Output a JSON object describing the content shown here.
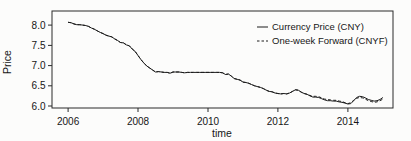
{
  "chart_data": {
    "type": "line",
    "title": "",
    "xlabel": "time",
    "ylabel": "Price",
    "xlim": [
      2005.54,
      2015.29
    ],
    "ylim": [
      5.95,
      8.35
    ],
    "x_ticks": [
      2006,
      2008,
      2010,
      2012,
      2014
    ],
    "y_ticks": [
      6.0,
      6.5,
      7.0,
      7.5,
      8.0
    ],
    "grid": false,
    "legend": {
      "position": "top-right",
      "entries": [
        {
          "label": "Currency Price (CNY)",
          "style": "solid"
        },
        {
          "label": "One-week Forward (CNYF)",
          "style": "dashed"
        }
      ]
    },
    "colors": {
      "line": "#1c1c1c",
      "text": "#161616",
      "border": "#2a2a2a",
      "background": "#fcfcfb"
    },
    "x": [
      2006.0,
      2006.083,
      2006.167,
      2006.25,
      2006.333,
      2006.417,
      2006.5,
      2006.583,
      2006.667,
      2006.75,
      2006.833,
      2006.917,
      2007.0,
      2007.083,
      2007.167,
      2007.25,
      2007.333,
      2007.417,
      2007.5,
      2007.583,
      2007.667,
      2007.75,
      2007.833,
      2007.917,
      2008.0,
      2008.083,
      2008.167,
      2008.25,
      2008.333,
      2008.417,
      2008.5,
      2008.583,
      2008.667,
      2008.75,
      2008.833,
      2008.917,
      2009.0,
      2009.083,
      2009.167,
      2009.25,
      2009.333,
      2009.417,
      2009.5,
      2009.583,
      2009.667,
      2009.75,
      2009.833,
      2009.917,
      2010.0,
      2010.083,
      2010.167,
      2010.25,
      2010.333,
      2010.417,
      2010.5,
      2010.583,
      2010.667,
      2010.75,
      2010.833,
      2010.917,
      2011.0,
      2011.083,
      2011.167,
      2011.25,
      2011.333,
      2011.417,
      2011.5,
      2011.583,
      2011.667,
      2011.75,
      2011.833,
      2011.917,
      2012.0,
      2012.083,
      2012.167,
      2012.25,
      2012.333,
      2012.417,
      2012.5,
      2012.583,
      2012.667,
      2012.75,
      2012.833,
      2012.917,
      2013.0,
      2013.083,
      2013.167,
      2013.25,
      2013.333,
      2013.417,
      2013.5,
      2013.583,
      2013.667,
      2013.75,
      2013.833,
      2013.917,
      2014.0,
      2014.083,
      2014.167,
      2014.25,
      2014.333,
      2014.417,
      2014.5,
      2014.583,
      2014.667,
      2014.75,
      2014.833,
      2014.917,
      2015.0
    ],
    "series": [
      {
        "name": "Currency Price (CNY)",
        "style": "solid",
        "values": [
          8.07,
          8.06,
          8.03,
          8.01,
          8.01,
          8.0,
          7.99,
          7.97,
          7.93,
          7.9,
          7.86,
          7.82,
          7.79,
          7.75,
          7.73,
          7.71,
          7.66,
          7.62,
          7.57,
          7.56,
          7.51,
          7.49,
          7.41,
          7.35,
          7.25,
          7.15,
          7.06,
          6.99,
          6.94,
          6.89,
          6.84,
          6.85,
          6.84,
          6.83,
          6.83,
          6.81,
          6.84,
          6.84,
          6.84,
          6.83,
          6.82,
          6.83,
          6.83,
          6.83,
          6.83,
          6.83,
          6.83,
          6.83,
          6.83,
          6.83,
          6.83,
          6.83,
          6.83,
          6.82,
          6.78,
          6.79,
          6.74,
          6.68,
          6.66,
          6.64,
          6.59,
          6.58,
          6.56,
          6.53,
          6.5,
          6.48,
          6.46,
          6.43,
          6.39,
          6.36,
          6.35,
          6.32,
          6.31,
          6.3,
          6.31,
          6.3,
          6.32,
          6.36,
          6.4,
          6.39,
          6.34,
          6.31,
          6.29,
          6.25,
          6.22,
          6.22,
          6.21,
          6.18,
          6.15,
          6.13,
          6.13,
          6.12,
          6.12,
          6.1,
          6.09,
          6.07,
          6.05,
          6.06,
          6.13,
          6.21,
          6.24,
          6.23,
          6.2,
          6.16,
          6.14,
          6.12,
          6.13,
          6.16,
          6.21
        ]
      },
      {
        "name": "One-week Forward (CNYF)",
        "style": "dashed",
        "values": [
          8.07,
          8.06,
          8.03,
          8.01,
          8.01,
          8.0,
          7.99,
          7.97,
          7.93,
          7.9,
          7.86,
          7.82,
          7.79,
          7.75,
          7.73,
          7.71,
          7.66,
          7.62,
          7.57,
          7.56,
          7.51,
          7.49,
          7.41,
          7.35,
          7.25,
          7.15,
          7.06,
          6.99,
          6.94,
          6.89,
          6.84,
          6.85,
          6.84,
          6.83,
          6.83,
          6.81,
          6.84,
          6.84,
          6.84,
          6.83,
          6.82,
          6.83,
          6.83,
          6.83,
          6.83,
          6.83,
          6.83,
          6.83,
          6.83,
          6.83,
          6.83,
          6.83,
          6.83,
          6.82,
          6.78,
          6.79,
          6.74,
          6.68,
          6.66,
          6.64,
          6.59,
          6.58,
          6.56,
          6.53,
          6.5,
          6.48,
          6.46,
          6.43,
          6.39,
          6.36,
          6.35,
          6.32,
          6.31,
          6.3,
          6.31,
          6.3,
          6.32,
          6.36,
          6.4,
          6.39,
          6.34,
          6.31,
          6.29,
          6.26,
          6.24,
          6.24,
          6.23,
          6.2,
          6.17,
          6.16,
          6.15,
          6.14,
          6.14,
          6.12,
          6.11,
          6.08,
          6.06,
          6.08,
          6.14,
          6.19,
          6.21,
          6.2,
          6.17,
          6.13,
          6.11,
          6.09,
          6.1,
          6.13,
          6.17
        ]
      }
    ]
  }
}
